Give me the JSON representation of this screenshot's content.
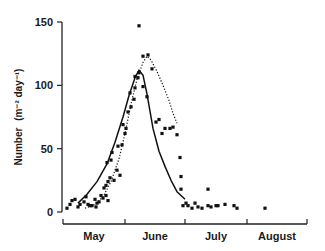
{
  "chart_data": {
    "type": "scatter",
    "title": "",
    "xlabel": "",
    "ylabel": "Number (m⁻² day⁻¹)",
    "ylim": [
      0,
      150
    ],
    "yticks": [
      0,
      50,
      100,
      150
    ],
    "x_unit": "days since May 1",
    "xlim": [
      0,
      122
    ],
    "x_categories": [
      "May",
      "June",
      "July",
      "August"
    ],
    "x_category_boundaries": [
      0,
      31,
      61,
      92,
      122
    ],
    "grid": false,
    "legend": null,
    "series": [
      {
        "name": "observations",
        "kind": "points",
        "points": [
          [
            2,
            3
          ],
          [
            3.5,
            6
          ],
          [
            4.5,
            9
          ],
          [
            6,
            10
          ],
          [
            7.5,
            4
          ],
          [
            8.5,
            6
          ],
          [
            10.5,
            8
          ],
          [
            11.5,
            12
          ],
          [
            12.5,
            6
          ],
          [
            13.5,
            5
          ],
          [
            14.5,
            5
          ],
          [
            16,
            10
          ],
          [
            17,
            7
          ],
          [
            18,
            8
          ],
          [
            16.5,
            4
          ],
          [
            19,
            13
          ],
          [
            20,
            11
          ],
          [
            21.5,
            13
          ],
          [
            22.5,
            9
          ],
          [
            20.5,
            19
          ],
          [
            21.5,
            21
          ],
          [
            22.5,
            24
          ],
          [
            23.5,
            27
          ],
          [
            25.5,
            25
          ],
          [
            27,
            33
          ],
          [
            28.5,
            29
          ],
          [
            24,
            41
          ],
          [
            22,
            39
          ],
          [
            24.5,
            47
          ],
          [
            27.5,
            52
          ],
          [
            29.5,
            53
          ],
          [
            31,
            62
          ],
          [
            31.5,
            66
          ],
          [
            30,
            69
          ],
          [
            32.5,
            79
          ],
          [
            34,
            83
          ],
          [
            35.5,
            89
          ],
          [
            33.5,
            94
          ],
          [
            36,
            98
          ],
          [
            37.5,
            106
          ],
          [
            38,
            110
          ],
          [
            36,
            107
          ],
          [
            38,
            147
          ],
          [
            40,
            123
          ],
          [
            42.5,
            124
          ],
          [
            44.5,
            113
          ],
          [
            40,
            99
          ],
          [
            42,
            91
          ],
          [
            46.5,
            71
          ],
          [
            48,
            73
          ],
          [
            49.5,
            62
          ],
          [
            51,
            66
          ],
          [
            53.5,
            66
          ],
          [
            55,
            67
          ],
          [
            57,
            61
          ],
          [
            58.5,
            43
          ],
          [
            59,
            28
          ],
          [
            59,
            18
          ],
          [
            60,
            5
          ],
          [
            61.5,
            7
          ],
          [
            62.5,
            5
          ],
          [
            64.5,
            3
          ],
          [
            66,
            7
          ],
          [
            67.5,
            4
          ],
          [
            69.5,
            3
          ],
          [
            72.5,
            5
          ],
          [
            72.5,
            18
          ],
          [
            74,
            4
          ],
          [
            76.5,
            5
          ],
          [
            77.5,
            5
          ],
          [
            81,
            6
          ],
          [
            85.5,
            5
          ],
          [
            87,
            3
          ],
          [
            101,
            3
          ]
        ]
      },
      {
        "name": "fitted curve (solid)",
        "kind": "line",
        "style": "solid",
        "points": [
          [
            7.5,
            7
          ],
          [
            12,
            14
          ],
          [
            17,
            24
          ],
          [
            22,
            38
          ],
          [
            26,
            55
          ],
          [
            30,
            75
          ],
          [
            33,
            92
          ],
          [
            36,
            106
          ],
          [
            38,
            112
          ],
          [
            40,
            108
          ],
          [
            42,
            93
          ],
          [
            45,
            66
          ],
          [
            48,
            48
          ],
          [
            51,
            36
          ],
          [
            54,
            25
          ],
          [
            57,
            16
          ],
          [
            61,
            10
          ]
        ]
      },
      {
        "name": "fitted curve (dotted)",
        "kind": "line",
        "style": "dotted",
        "points": [
          [
            11,
            3
          ],
          [
            16,
            6
          ],
          [
            20,
            12
          ],
          [
            24,
            24
          ],
          [
            28,
            42
          ],
          [
            31,
            62
          ],
          [
            34,
            85
          ],
          [
            37,
            105
          ],
          [
            40,
            118
          ],
          [
            42,
            123
          ],
          [
            44,
            120
          ],
          [
            47,
            111
          ],
          [
            50,
            100
          ],
          [
            53,
            88
          ],
          [
            55,
            78
          ],
          [
            57,
            70
          ]
        ]
      }
    ]
  },
  "axes": {
    "y_tick_labels": [
      "0",
      "50",
      "100",
      "150"
    ],
    "x_tick_labels": [
      "May",
      "June",
      "July",
      "August"
    ],
    "y_title_main": "Number",
    "y_title_unit": "(m⁻² day⁻¹)"
  }
}
